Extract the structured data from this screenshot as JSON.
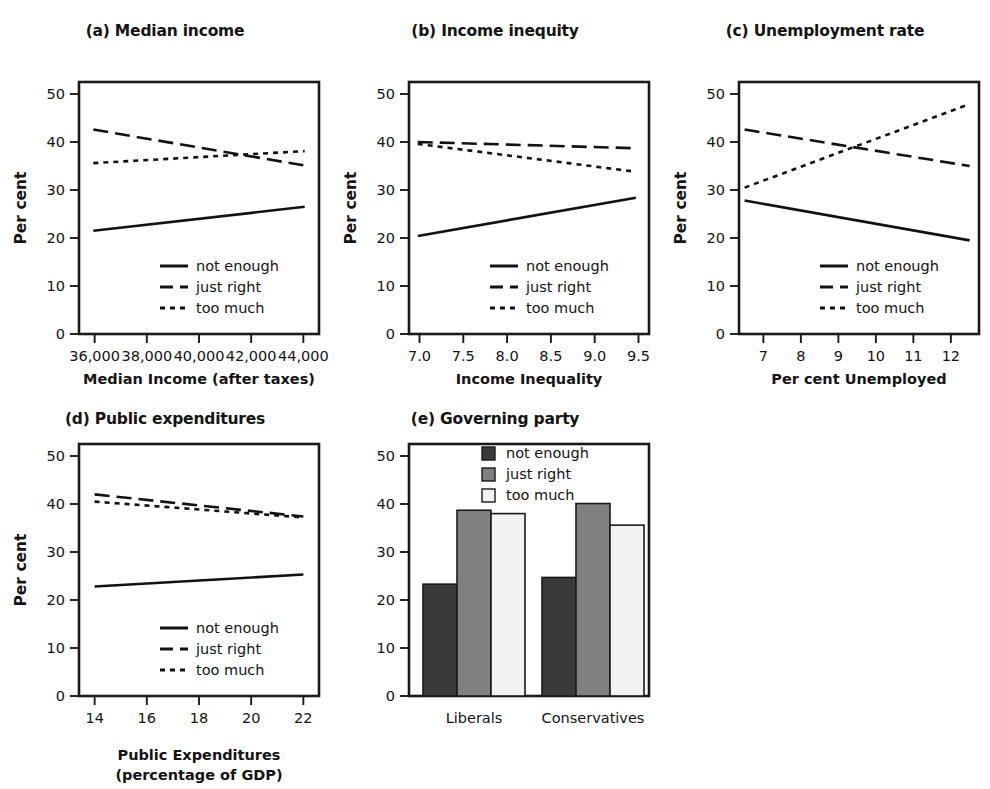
{
  "figure": {
    "ylabel": "Per cent",
    "legend_labels": [
      "not enough",
      "just right",
      "too much"
    ],
    "yticks": [
      0,
      10,
      20,
      30,
      40,
      50
    ],
    "ylim": [
      0,
      52.5
    ],
    "colors": {
      "line": "#121212",
      "not_enough_bar": "#3a3a3a",
      "just_right_bar": "#808080",
      "too_much_bar": "#f2f2f2",
      "frame": "#1a1a1a"
    }
  },
  "panels": {
    "a": {
      "title": "(a) Median income",
      "xlabel": "Median Income (after taxes)",
      "xticks": [
        "36,000",
        "38,000",
        "40,000",
        "42,000",
        "44,000"
      ],
      "xtick_values": [
        36000,
        38000,
        40000,
        42000,
        44000
      ]
    },
    "b": {
      "title": "(b) Income inequity",
      "xlabel": "Income Inequality",
      "xticks": [
        "7.0",
        "7.5",
        "8.0",
        "8.5",
        "9.0",
        "9.5"
      ],
      "xtick_values": [
        7.0,
        7.5,
        8.0,
        8.5,
        9.0,
        9.5
      ]
    },
    "c": {
      "title": "(c) Unemployment rate",
      "xlabel": "Per cent Unemployed",
      "xticks": [
        "7",
        "8",
        "9",
        "10",
        "11",
        "12"
      ],
      "xtick_values": [
        7,
        8,
        9,
        10,
        11,
        12
      ]
    },
    "d": {
      "title": "(d) Public expenditures",
      "xlabel_line1": "Public Expenditures",
      "xlabel_line2": "(percentage of GDP)",
      "xticks": [
        "14",
        "16",
        "18",
        "20",
        "22"
      ],
      "xtick_values": [
        14,
        16,
        18,
        20,
        22
      ]
    },
    "e": {
      "title": "(e) Governing party",
      "xticks": [
        "Liberals",
        "Conservatives"
      ]
    }
  },
  "chart_data": [
    {
      "type": "line",
      "title": "(a) Median income",
      "xlabel": "Median Income (after taxes)",
      "ylabel": "Per cent",
      "xlim": [
        35400,
        44600
      ],
      "ylim": [
        0,
        52.5
      ],
      "xticks": [
        36000,
        38000,
        40000,
        42000,
        44000
      ],
      "yticks": [
        0,
        10,
        20,
        30,
        40,
        50
      ],
      "grid": false,
      "legend_position": "lower-center",
      "series": [
        {
          "name": "not enough",
          "style": "solid",
          "x": [
            35950,
            44050
          ],
          "values": [
            21.5,
            26.5
          ]
        },
        {
          "name": "just right",
          "style": "dashed",
          "x": [
            35950,
            44050
          ],
          "values": [
            42.6,
            35.1
          ]
        },
        {
          "name": "too much",
          "style": "dotted",
          "x": [
            35950,
            44050
          ],
          "values": [
            35.6,
            38.1
          ]
        }
      ]
    },
    {
      "type": "line",
      "title": "(b) Income inequity",
      "xlabel": "Income Inequality",
      "ylabel": "Per cent",
      "xlim": [
        6.88,
        9.62
      ],
      "ylim": [
        0,
        52.5
      ],
      "xticks": [
        7.0,
        7.5,
        8.0,
        8.5,
        9.0,
        9.5
      ],
      "yticks": [
        0,
        10,
        20,
        30,
        40,
        50
      ],
      "grid": false,
      "legend_position": "lower-center",
      "series": [
        {
          "name": "not enough",
          "style": "solid",
          "x": [
            6.98,
            9.47
          ],
          "values": [
            20.4,
            28.4
          ]
        },
        {
          "name": "just right",
          "style": "dashed",
          "x": [
            6.98,
            9.47
          ],
          "values": [
            40.0,
            38.7
          ]
        },
        {
          "name": "too much",
          "style": "dotted",
          "x": [
            6.98,
            9.47
          ],
          "values": [
            39.6,
            33.8
          ]
        }
      ]
    },
    {
      "type": "line",
      "title": "(c) Unemployment rate",
      "xlabel": "Per cent Unemployed",
      "ylabel": "Per cent",
      "xlim": [
        6.35,
        12.75
      ],
      "ylim": [
        0,
        52.5
      ],
      "xticks": [
        7,
        8,
        9,
        10,
        11,
        12
      ],
      "yticks": [
        0,
        10,
        20,
        30,
        40,
        50
      ],
      "grid": false,
      "legend_position": "lower-center",
      "series": [
        {
          "name": "not enough",
          "style": "solid",
          "x": [
            6.5,
            12.5
          ],
          "values": [
            27.8,
            19.5
          ]
        },
        {
          "name": "just right",
          "style": "dashed",
          "x": [
            6.5,
            12.5
          ],
          "values": [
            42.6,
            35.0
          ]
        },
        {
          "name": "too much",
          "style": "dotted",
          "x": [
            6.5,
            12.5
          ],
          "values": [
            30.5,
            47.9
          ]
        }
      ]
    },
    {
      "type": "line",
      "title": "(d) Public expenditures",
      "xlabel": "Public Expenditures (percentage of GDP)",
      "ylabel": "Per cent",
      "xlim": [
        13.4,
        22.6
      ],
      "ylim": [
        0,
        52.5
      ],
      "xticks": [
        14,
        16,
        18,
        20,
        22
      ],
      "yticks": [
        0,
        10,
        20,
        30,
        40,
        50
      ],
      "grid": false,
      "legend_position": "lower-center",
      "series": [
        {
          "name": "not enough",
          "style": "solid",
          "x": [
            14.0,
            22.0
          ],
          "values": [
            22.8,
            25.3
          ]
        },
        {
          "name": "just right",
          "style": "dashed",
          "x": [
            14.0,
            22.0
          ],
          "values": [
            42.0,
            37.4
          ]
        },
        {
          "name": "too much",
          "style": "dotted",
          "x": [
            14.0,
            22.0
          ],
          "values": [
            40.5,
            37.2
          ]
        }
      ]
    },
    {
      "type": "bar",
      "title": "(e) Governing party",
      "xlabel": "",
      "ylabel": "Per cent",
      "categories": [
        "Liberals",
        "Conservatives"
      ],
      "ylim": [
        0,
        52.5
      ],
      "yticks": [
        0,
        10,
        20,
        30,
        40,
        50
      ],
      "grid": false,
      "legend_position": "upper-center",
      "series": [
        {
          "name": "not enough",
          "color": "#3a3a3a",
          "values": [
            23.3,
            24.7
          ]
        },
        {
          "name": "just right",
          "color": "#808080",
          "values": [
            38.7,
            40.1
          ]
        },
        {
          "name": "too much",
          "color": "#f2f2f2",
          "values": [
            38.0,
            35.6
          ]
        }
      ]
    }
  ]
}
